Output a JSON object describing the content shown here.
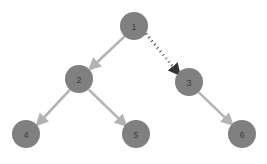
{
  "diagram": {
    "type": "directed-tree-graph",
    "background_color": "#ffffff",
    "node_fill_color": "#808080",
    "node_label_color": "#3c3c3c",
    "solid_edge_color": "#b3b3b3",
    "dotted_edge_color": "#333333",
    "node_radius": 14,
    "nodes": [
      {
        "id": "1",
        "label": "1",
        "cx": 134,
        "cy": 26
      },
      {
        "id": "2",
        "label": "2",
        "cx": 79,
        "cy": 79
      },
      {
        "id": "3",
        "label": "3",
        "cx": 189,
        "cy": 82
      },
      {
        "id": "4",
        "label": "4",
        "cx": 26,
        "cy": 134
      },
      {
        "id": "5",
        "label": "5",
        "cx": 136,
        "cy": 134
      },
      {
        "id": "6",
        "label": "6",
        "cx": 242,
        "cy": 134
      }
    ],
    "edges": [
      {
        "id": "e-1-2",
        "from": "1",
        "to": "2",
        "style": "solid",
        "color": "#b3b3b3"
      },
      {
        "id": "e-1-3",
        "from": "1",
        "to": "3",
        "style": "dotted",
        "color": "#333333"
      },
      {
        "id": "e-2-4",
        "from": "2",
        "to": "4",
        "style": "solid",
        "color": "#b3b3b3"
      },
      {
        "id": "e-2-5",
        "from": "2",
        "to": "5",
        "style": "solid",
        "color": "#b3b3b3"
      },
      {
        "id": "e-3-6",
        "from": "3",
        "to": "6",
        "style": "solid",
        "color": "#b3b3b3"
      }
    ]
  }
}
